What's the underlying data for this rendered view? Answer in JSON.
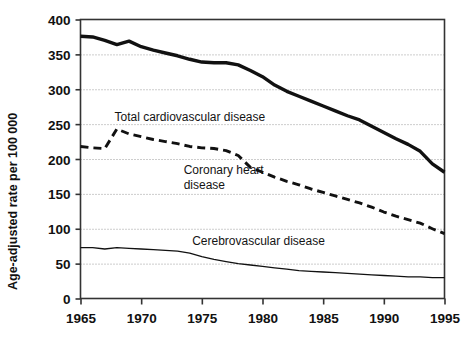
{
  "chart_data": {
    "type": "line",
    "title": "",
    "xlabel": "",
    "ylabel": "Age-adjusted rate per 100 000",
    "xlim": [
      1965,
      1995
    ],
    "ylim": [
      0,
      400
    ],
    "xticks": [
      "1965",
      "1970",
      "1975",
      "1980",
      "1985",
      "1990",
      "1995"
    ],
    "yticks": [
      "0",
      "50",
      "100",
      "150",
      "200",
      "250",
      "300",
      "350",
      "400"
    ],
    "grid": "horizontal-dotted",
    "legend_position": "inline-annotations",
    "x": [
      1965,
      1966,
      1967,
      1968,
      1969,
      1970,
      1971,
      1972,
      1973,
      1974,
      1975,
      1976,
      1977,
      1978,
      1979,
      1980,
      1981,
      1982,
      1983,
      1984,
      1985,
      1986,
      1987,
      1988,
      1989,
      1990,
      1991,
      1992,
      1993,
      1994,
      1995
    ],
    "series": [
      {
        "name": "Total cardiovascular disease",
        "style": "solid-thick",
        "color": "#111111",
        "label_x": 1967.8,
        "label_y": 255,
        "values": [
          376,
          375,
          370,
          364,
          369,
          361,
          356,
          352,
          348,
          343,
          339,
          338,
          338,
          335,
          327,
          318,
          306,
          297,
          290,
          283,
          276,
          269,
          262,
          256,
          247,
          238,
          229,
          221,
          211,
          193,
          181
        ]
      },
      {
        "name": "Coronary heart disease",
        "style": "dashed",
        "color": "#111111",
        "label_x": 1973.5,
        "label_y": 178,
        "values": [
          218,
          216,
          215,
          243,
          236,
          232,
          228,
          225,
          222,
          218,
          216,
          215,
          212,
          205,
          188,
          181,
          174,
          168,
          163,
          157,
          152,
          147,
          142,
          137,
          131,
          124,
          118,
          113,
          108,
          100,
          93
        ]
      },
      {
        "name": "Cerebrovascular disease",
        "style": "solid-thin",
        "color": "#111111",
        "label_x": 1974.2,
        "label_y": 77,
        "values": [
          73,
          73,
          71,
          73,
          72,
          71,
          70,
          69,
          68,
          65,
          60,
          56,
          53,
          50,
          48,
          46,
          44,
          42,
          40,
          39,
          38,
          37,
          36,
          35,
          34,
          33,
          32,
          31,
          31,
          30,
          30
        ]
      }
    ]
  },
  "axis": {
    "y_title": "Age-adjusted rate per 100 000"
  }
}
